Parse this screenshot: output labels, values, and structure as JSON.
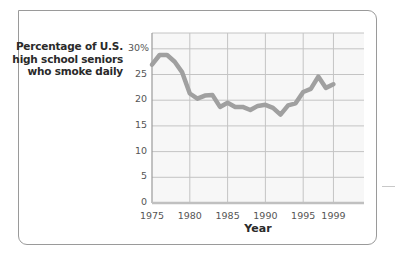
{
  "chart_data": {
    "type": "line",
    "title": "",
    "xlabel": "Year",
    "ylabel": "Percentage of U.S. high school seniors who smoke daily",
    "ylabel_lines": [
      "Percentage of U.S.",
      "high school seniors",
      "who smoke daily"
    ],
    "x": [
      1975,
      1976,
      1977,
      1978,
      1979,
      1980,
      1981,
      1982,
      1983,
      1984,
      1985,
      1986,
      1987,
      1988,
      1989,
      1990,
      1991,
      1992,
      1993,
      1994,
      1995,
      1996,
      1997,
      1998,
      1999
    ],
    "series": [
      {
        "name": "Daily smokers (%)",
        "values": [
          26.9,
          28.8,
          28.8,
          27.5,
          25.4,
          21.3,
          20.3,
          20.9,
          21.0,
          18.7,
          19.5,
          18.7,
          18.7,
          18.1,
          18.9,
          19.1,
          18.5,
          17.2,
          19.0,
          19.4,
          21.6,
          22.2,
          24.6,
          22.4,
          23.1
        ],
        "color": "#a0a0a0"
      }
    ],
    "xticks": [
      "1975",
      "1980",
      "1985",
      "1990",
      "1995",
      "1999"
    ],
    "yticks": [
      "0",
      "5",
      "10",
      "15",
      "20",
      "25",
      "30%"
    ],
    "xlim": [
      1975,
      2003
    ],
    "ylim": [
      0,
      33
    ],
    "grid": true,
    "legend": "none"
  }
}
